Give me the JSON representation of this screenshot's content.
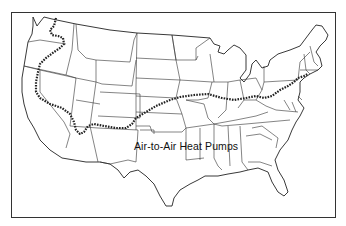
{
  "map": {
    "title_visible": false,
    "region": "Contiguous United States",
    "label": "Air-to-Air Heat Pumps",
    "features": {
      "frame": "rectangular border around map",
      "state_boundaries": true,
      "dotted_boundary_line": "Northern limit line running from western Washington south through Oregon/Nevada/California, east across southern Arizona/New Mexico, northeast through Kansas/Missouri, across Illinois/Indiana/Ohio to New Jersey/Connecticut coast"
    },
    "colors": {
      "background": "#ffffff",
      "lines": "#222222"
    }
  }
}
